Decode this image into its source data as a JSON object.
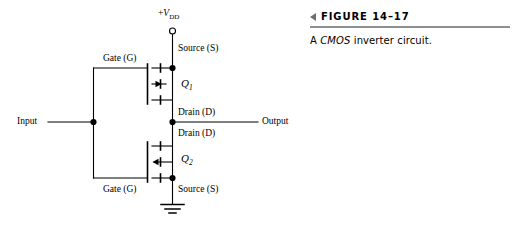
{
  "figure": {
    "marker_icon": "triangle-left-icon",
    "number_label": "FIGURE 14–17",
    "caption_prefix": "A ",
    "caption_emphasis": "CMOS",
    "caption_suffix": " inverter circuit.",
    "caption_full": "A CMOS inverter circuit.",
    "rule_color": "#8c9093",
    "marker_color": "#6b6f72"
  },
  "circuit": {
    "title": "CMOS inverter",
    "line_color": "#000000",
    "supply": {
      "label_sign": "+",
      "label_symbol": "V",
      "label_subscript": "DD",
      "terminal_icon": "open-circle-terminal-icon"
    },
    "input": {
      "label": "Input",
      "node_icon": "junction-dot-icon"
    },
    "output": {
      "label": "Output",
      "node_icon": "junction-dot-icon"
    },
    "ground": {
      "icon": "ground-symbol-icon"
    },
    "transistors": [
      {
        "id": "Q1",
        "name_letter": "Q",
        "name_subscript": "1",
        "channel": "p-channel",
        "arrow_direction": "right",
        "gate_label": "Gate (G)",
        "source_label": "Source (S)",
        "drain_label": "Drain (D)"
      },
      {
        "id": "Q2",
        "name_letter": "Q",
        "name_subscript": "2",
        "channel": "n-channel",
        "arrow_direction": "left",
        "gate_label": "Gate (G)",
        "source_label": "Source (S)",
        "drain_label": "Drain (D)"
      }
    ]
  }
}
